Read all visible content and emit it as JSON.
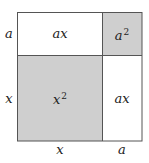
{
  "diagram": {
    "title": "",
    "colors": {
      "shaded": "#cfcfcf",
      "unshaded": "#ffffff",
      "stroke": "#555555"
    },
    "regions": [
      {
        "id": "top-left",
        "label_base": "a",
        "label_base2": "x",
        "text": "ax",
        "shaded": false
      },
      {
        "id": "top-right",
        "label_base": "a",
        "exponent": "2",
        "text": "a2",
        "shaded": true
      },
      {
        "id": "bottom-left",
        "label_base": "x",
        "exponent": "2",
        "text": "x2",
        "shaded": true
      },
      {
        "id": "bottom-right",
        "label_base": "a",
        "label_base2": "x",
        "text": "ax",
        "shaded": false
      }
    ],
    "side_labels": {
      "left_top": "a",
      "left_bottom": "x",
      "bottom_left": "x",
      "bottom_right": "a"
    },
    "cells": {
      "top_left": "ax",
      "top_right_base": "a",
      "top_right_exp": "2",
      "bottom_left_base": "x",
      "bottom_left_exp": "2",
      "bottom_right": "ax"
    }
  }
}
